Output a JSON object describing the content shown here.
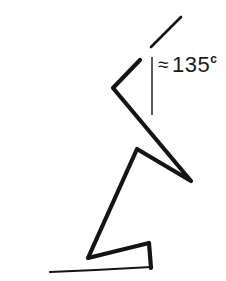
{
  "figure": {
    "title": "",
    "stroke_color": "#141414",
    "background_color": "#ffffff",
    "annotation": {
      "approx_sign": "≈",
      "value": "135",
      "unit": "c",
      "full_text": "≈ 135ᶜ"
    },
    "elements": {
      "zigzag_label": "zigzag-polyline",
      "ray_label": "angle-ray",
      "reference_line_label": "vertical-reference-line",
      "ground_line_label": "ground-line"
    }
  },
  "chart_data": {
    "type": "diagram",
    "title": "",
    "xlabel": "",
    "ylabel": "",
    "annotations": [
      {
        "text": "≈ 135ᶜ",
        "x": 158,
        "y": 54,
        "meaning": "approximately 135 centesimal degrees"
      }
    ],
    "series": [
      {
        "name": "zigzag-polyline",
        "type": "polyline",
        "closed": false,
        "stroke_width": 4.2,
        "join": "round",
        "points": [
          [
            140,
            60
          ],
          [
            113,
            88
          ],
          [
            191,
            181
          ],
          [
            137,
            149
          ],
          [
            88,
            258
          ],
          [
            149,
            243
          ],
          [
            151,
            268
          ]
        ]
      },
      {
        "name": "angle-ray",
        "type": "line",
        "stroke_width": 2.6,
        "points": [
          [
            151,
            47
          ],
          [
            181,
            17
          ]
        ]
      },
      {
        "name": "vertical-reference-line",
        "type": "line",
        "stroke_width": 1.4,
        "points": [
          [
            152,
            57
          ],
          [
            152,
            115
          ]
        ]
      },
      {
        "name": "ground-line",
        "type": "taper-curve",
        "stroke_width": 2.2,
        "points": [
          [
            50,
            272
          ],
          [
            100,
            270
          ],
          [
            151,
            267
          ]
        ]
      }
    ],
    "grid": false,
    "legend": "none"
  }
}
